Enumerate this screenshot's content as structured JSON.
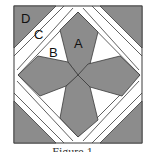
{
  "figure": {
    "labels": {
      "a": "A",
      "b": "B",
      "c": "C",
      "d": "D"
    },
    "caption": "Figure 1",
    "colors": {
      "shaded": "#8c8c8c",
      "background": "#ffffff",
      "outline": "#3a3a3a"
    }
  }
}
